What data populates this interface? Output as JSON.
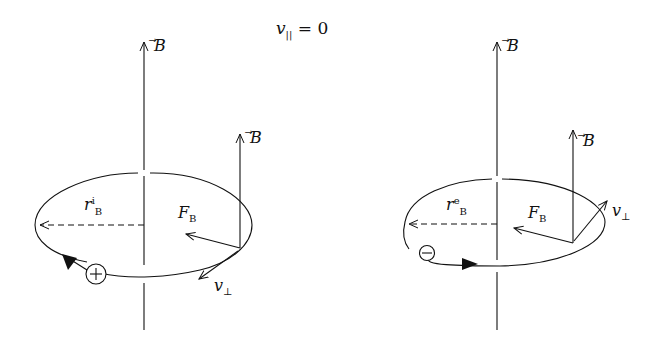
{
  "title": {
    "var": "v",
    "sub": "||",
    "rest": " = 0"
  },
  "panels": [
    {
      "name": "ion",
      "axis_label": "B",
      "local_b_label": "B",
      "radius_label": "r",
      "radius_sup": "i",
      "radius_sub": "B",
      "force_label": "F",
      "force_sub": "B",
      "velocity_label": "v",
      "velocity_sub": "⊥",
      "charge": "+"
    },
    {
      "name": "electron",
      "axis_label": "B",
      "local_b_label": "B",
      "radius_label": "r",
      "radius_sup": "e",
      "radius_sub": "B",
      "force_label": "F",
      "force_sub": "B",
      "velocity_label": "v",
      "velocity_sub": "⊥",
      "charge": "−"
    }
  ]
}
